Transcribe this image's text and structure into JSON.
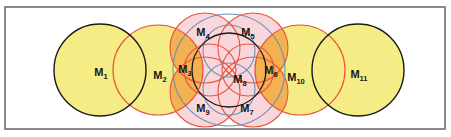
{
  "figure": {
    "kind": "venn-circle-overlap-diagram",
    "title": "",
    "frame": {
      "border_color": "#8a8a8a",
      "border_width": 2,
      "background": "#ffffff",
      "x": 5,
      "y": 7,
      "width": 441,
      "height": 123
    },
    "palette": {
      "yellow_fill": "#F5EC85",
      "pink_fill": "#F8D6DC",
      "orange_fill": "#F5B95C",
      "black_stroke": "#1A1A1A",
      "red_stroke": "#E8543A",
      "blue_stroke": "#6E8FB0",
      "label_color": "#171717"
    },
    "labels": [
      {
        "id": "M1",
        "base": "M",
        "sub": "1",
        "x": 101,
        "y": 76,
        "region": "left-large-yellow-black-circle"
      },
      {
        "id": "M2",
        "base": "M",
        "sub": "2",
        "x": 160,
        "y": 79,
        "region": "second-large-yellow-red-circle"
      },
      {
        "id": "M3",
        "base": "M",
        "sub": "3",
        "x": 185,
        "y": 73,
        "region": "left-orange-overlap-lens"
      },
      {
        "id": "M4",
        "base": "M",
        "sub": "4",
        "x": 203,
        "y": 36,
        "region": "top-left-pink-lens"
      },
      {
        "id": "M5",
        "base": "M",
        "sub": "5",
        "x": 248,
        "y": 36,
        "region": "top-right-pink-lens"
      },
      {
        "id": "M6",
        "base": "M",
        "sub": "6",
        "x": 271,
        "y": 74,
        "region": "right-orange-overlap-lens"
      },
      {
        "id": "M7",
        "base": "M",
        "sub": "7",
        "x": 247,
        "y": 112,
        "region": "bottom-right-pink-lens"
      },
      {
        "id": "M8",
        "base": "M",
        "sub": "8",
        "x": 240,
        "y": 83,
        "region": "center-black-circle"
      },
      {
        "id": "M9",
        "base": "M",
        "sub": "9",
        "x": 203,
        "y": 112,
        "region": "bottom-left-pink-lens"
      },
      {
        "id": "M10",
        "base": "M",
        "sub": "10",
        "x": 296,
        "y": 81,
        "region": "tenth-large-yellow-red-circle"
      },
      {
        "id": "M11",
        "base": "M",
        "sub": "11",
        "x": 359,
        "y": 78,
        "region": "right-large-yellow-black-circle"
      }
    ],
    "circles": [
      {
        "name": "M1-large-yellow",
        "cx": 100,
        "cy": 70,
        "r": 46,
        "stroke": "#1A1A1A",
        "fill": "#F5EC85"
      },
      {
        "name": "M2-large-yellow",
        "cx": 158,
        "cy": 70,
        "r": 45,
        "stroke": "#E8543A",
        "fill": "#F5EC85"
      },
      {
        "name": "M10-large-yellow",
        "cx": 300,
        "cy": 70,
        "r": 45,
        "stroke": "#E8543A",
        "fill": "#F5EC85"
      },
      {
        "name": "M11-large-yellow",
        "cx": 358,
        "cy": 70,
        "r": 46,
        "stroke": "#1A1A1A",
        "fill": "#F5EC85"
      },
      {
        "name": "cluster-wide-blue",
        "cx": 229,
        "cy": 70,
        "r": 56,
        "stroke": "#6E8FB0",
        "fill": "none"
      },
      {
        "name": "cluster-center-black",
        "cx": 229,
        "cy": 70,
        "r": 37,
        "stroke": "#1A1A1A",
        "fill": "none"
      },
      {
        "name": "petal-left-red",
        "cx": 210,
        "cy": 70,
        "r": 26,
        "stroke": "#E8543A",
        "fill": "none"
      },
      {
        "name": "petal-right-red",
        "cx": 248,
        "cy": 70,
        "r": 26,
        "stroke": "#E8543A",
        "fill": "none"
      },
      {
        "name": "petal-top-blue",
        "cx": 229,
        "cy": 51,
        "r": 26,
        "stroke": "#6E8FB0",
        "fill": "none"
      },
      {
        "name": "petal-bottom-blue",
        "cx": 229,
        "cy": 89,
        "r": 26,
        "stroke": "#6E8FB0",
        "fill": "none"
      },
      {
        "name": "outer-top-left-red",
        "cx": 205,
        "cy": 48,
        "r": 35,
        "stroke": "#E8543A",
        "fill": "none"
      },
      {
        "name": "outer-top-right-red",
        "cx": 253,
        "cy": 48,
        "r": 35,
        "stroke": "#E8543A",
        "fill": "none"
      },
      {
        "name": "outer-bottom-left-red",
        "cx": 205,
        "cy": 92,
        "r": 35,
        "stroke": "#E8543A",
        "fill": "none"
      },
      {
        "name": "outer-bottom-right-red",
        "cx": 253,
        "cy": 92,
        "r": 35,
        "stroke": "#E8543A",
        "fill": "none"
      }
    ]
  },
  "chart_data": {
    "type": "diagram",
    "title": "",
    "region_labels": [
      "M1",
      "M2",
      "M3",
      "M4",
      "M5",
      "M6",
      "M7",
      "M8",
      "M9",
      "M10",
      "M11"
    ],
    "region_count": 11
  }
}
